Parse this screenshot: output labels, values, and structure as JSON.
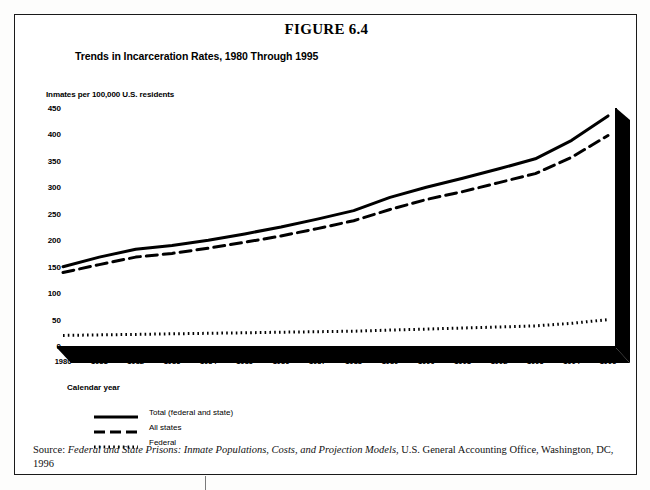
{
  "figure": {
    "number": "FIGURE 6.4",
    "subtitle": "Trends in Incarceration Rates, 1980 Through 1995"
  },
  "source": {
    "prefix": "Source:",
    "italic_title": "Federal and State Prisons: Inmate Populations, Costs, and Projection Models",
    "rest": ", U.S. General Accounting Office, Washington, DC, 1996"
  },
  "legend": {
    "items": [
      {
        "label": "Total (federal and state)",
        "style": "solid"
      },
      {
        "label": "All states",
        "style": "dashed"
      },
      {
        "label": "Federal",
        "style": "dotted"
      }
    ]
  },
  "colors": {
    "ink": "#000000",
    "frame": "#1a1a1a",
    "paper": "#ffffff"
  },
  "chart_data": {
    "type": "line",
    "title": "Trends in Incarceration Rates, 1980 Through 1995",
    "xlabel": "Calendar year",
    "ylabel": "Inmates per 100,000 U.S. residents",
    "grid": false,
    "legend_position": "below-left",
    "xlim": [
      1980,
      1995
    ],
    "ylim": [
      0,
      450
    ],
    "yticks": [
      0,
      50,
      100,
      150,
      200,
      250,
      300,
      350,
      400,
      450
    ],
    "categories": [
      1980,
      1981,
      1982,
      1983,
      1984,
      1985,
      1986,
      1987,
      1988,
      1989,
      1990,
      1991,
      1992,
      1993,
      1994,
      1995
    ],
    "xticklabels": [
      "1980",
      "1981",
      "1982",
      "1983",
      "1984",
      "1985",
      "1986",
      "1987",
      "1988",
      "1989",
      "1990",
      "1991",
      "1992",
      "1993",
      "1994",
      "1995"
    ],
    "series": [
      {
        "name": "Total (federal and state)",
        "style": "solid",
        "values": [
          150,
          168,
          183,
          190,
          200,
          212,
          225,
          240,
          256,
          281,
          300,
          317,
          335,
          354,
          389,
          435
        ]
      },
      {
        "name": "All states",
        "style": "dashed",
        "values": [
          139,
          154,
          168,
          175,
          185,
          196,
          208,
          222,
          237,
          258,
          277,
          292,
          309,
          326,
          357,
          398
        ]
      },
      {
        "name": "Federal",
        "style": "dotted",
        "values": [
          20,
          21,
          22,
          23,
          24,
          25,
          26,
          27,
          28,
          30,
          32,
          34,
          36,
          38,
          43,
          50
        ]
      }
    ]
  }
}
